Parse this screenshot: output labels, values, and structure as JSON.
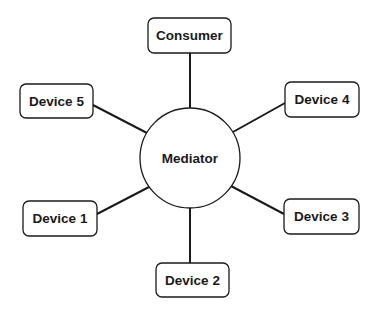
{
  "diagram": {
    "type": "star-topology",
    "hub": {
      "label": "Mediator",
      "cx": 190,
      "cy": 158,
      "r": 50
    },
    "nodes": [
      {
        "id": "consumer",
        "label": "Consumer",
        "x": 148,
        "y": 18,
        "w": 83,
        "h": 35
      },
      {
        "id": "device5",
        "label": "Device 5",
        "x": 20,
        "y": 84,
        "w": 73,
        "h": 34
      },
      {
        "id": "device4",
        "label": "Device 4",
        "x": 285,
        "y": 82,
        "w": 74,
        "h": 35
      },
      {
        "id": "device1",
        "label": "Device 1",
        "x": 23,
        "y": 201,
        "w": 74,
        "h": 35
      },
      {
        "id": "device3",
        "label": "Device 3",
        "x": 284,
        "y": 199,
        "w": 75,
        "h": 35
      },
      {
        "id": "device2",
        "label": "Device 2",
        "x": 156,
        "y": 263,
        "w": 73,
        "h": 34
      }
    ],
    "edges": [
      {
        "from": "consumer",
        "to": "Mediator",
        "x1": 190,
        "y1": 53,
        "x2": 190,
        "y2": 108
      },
      {
        "from": "device5",
        "to": "Mediator",
        "x1": 93,
        "y1": 105,
        "x2": 147,
        "y2": 133
      },
      {
        "from": "device4",
        "to": "Mediator",
        "x1": 285,
        "y1": 103,
        "x2": 233,
        "y2": 132
      },
      {
        "from": "device1",
        "to": "Mediator",
        "x1": 97,
        "y1": 214,
        "x2": 149,
        "y2": 187
      },
      {
        "from": "device3",
        "to": "Mediator",
        "x1": 284,
        "y1": 214,
        "x2": 231,
        "y2": 186
      },
      {
        "from": "device2",
        "to": "Mediator",
        "x1": 190,
        "y1": 208,
        "x2": 190,
        "y2": 263
      }
    ]
  }
}
